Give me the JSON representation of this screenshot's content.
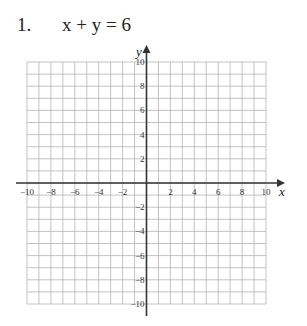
{
  "problem": {
    "number": "1.",
    "equation": "x + y = 6"
  },
  "chart_data": {
    "type": "line",
    "title": "x + y = 6",
    "xlabel": "x",
    "ylabel": "y",
    "xlim": [
      -10,
      10
    ],
    "ylim": [
      -10,
      10
    ],
    "grid": true,
    "grid_step": 1,
    "x_tick_labels": [
      "-10",
      "-8",
      "-6",
      "-4",
      "-2",
      "2",
      "4",
      "6",
      "8",
      "10"
    ],
    "y_tick_labels": [
      "10",
      "8",
      "6",
      "4",
      "2",
      "-2",
      "-4",
      "-6",
      "-8",
      "-10"
    ],
    "series": []
  },
  "colors": {
    "grid": "#b4b4b4",
    "axis": "#333333",
    "text": "#222222"
  }
}
